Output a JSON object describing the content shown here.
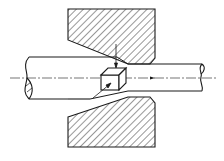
{
  "figure": {
    "labels": []
  },
  "parts": [
    {
      "name": "drawing-die-upper-half",
      "hatched": true
    },
    {
      "name": "drawing-die-lower-half",
      "hatched": true
    },
    {
      "name": "input-rod",
      "break_mark": "left"
    },
    {
      "name": "output-rod",
      "break_mark": "right"
    },
    {
      "name": "volume-element",
      "shape": "cube"
    },
    {
      "name": "centerline",
      "style": "dash-dot"
    },
    {
      "name": "drawing-direction-arrow",
      "direction": "right"
    }
  ],
  "colors": {
    "line": "#1a1a1a",
    "background": "#ffffff"
  }
}
